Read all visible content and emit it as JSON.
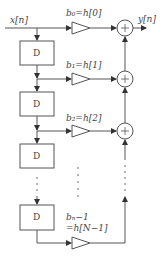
{
  "diagram": {
    "input_label": "x[n]",
    "output_label": "y[n]",
    "delay_label": "D",
    "coefficients": [
      {
        "label": "b₀=h[0]"
      },
      {
        "label": "b₁=h[1]"
      },
      {
        "label": "b₂=h[2]"
      },
      {
        "label_line1": "bₙ−1",
        "label_line2": "=h[N−1]"
      }
    ],
    "adder_symbol": "+",
    "colors": {
      "stroke": "#555555",
      "text": "#444444"
    }
  }
}
